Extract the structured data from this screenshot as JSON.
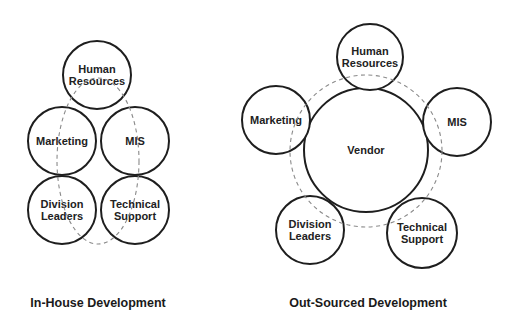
{
  "diagrams": [
    {
      "id": "in-house",
      "caption": "In-House Development",
      "caption_pos": {
        "x": 98,
        "y": 307
      },
      "boundary": {
        "shape": "ellipse",
        "cx": 98,
        "cy": 161,
        "rx": 41,
        "ry": 83
      },
      "nodes": [
        {
          "name": "human-resources",
          "lines": [
            "Human",
            "Resources"
          ],
          "cx": 97,
          "cy": 75,
          "r": 34
        },
        {
          "name": "marketing",
          "lines": [
            "Marketing"
          ],
          "cx": 62,
          "cy": 141,
          "r": 34
        },
        {
          "name": "mis",
          "lines": [
            "MIS"
          ],
          "cx": 135,
          "cy": 141,
          "r": 34
        },
        {
          "name": "division-leaders",
          "lines": [
            "Division",
            "Leaders"
          ],
          "cx": 62,
          "cy": 210,
          "r": 34
        },
        {
          "name": "technical-support",
          "lines": [
            "Technical",
            "Support"
          ],
          "cx": 135,
          "cy": 210,
          "r": 34
        }
      ]
    },
    {
      "id": "out-sourced",
      "caption": "Out-Sourced Development",
      "caption_pos": {
        "x": 368,
        "y": 307
      },
      "boundary": {
        "shape": "circle",
        "cx": 366,
        "cy": 151,
        "r": 76
      },
      "center_node": {
        "name": "vendor",
        "lines": [
          "Vendor"
        ],
        "cx": 366,
        "cy": 150,
        "r": 62
      },
      "nodes": [
        {
          "name": "human-resources",
          "lines": [
            "Human",
            "Resources"
          ],
          "cx": 370,
          "cy": 57,
          "r": 33
        },
        {
          "name": "marketing",
          "lines": [
            "Marketing"
          ],
          "cx": 276,
          "cy": 120,
          "r": 34
        },
        {
          "name": "mis",
          "lines": [
            "MIS"
          ],
          "cx": 457,
          "cy": 122,
          "r": 34
        },
        {
          "name": "division-leaders",
          "lines": [
            "Division",
            "Leaders"
          ],
          "cx": 310,
          "cy": 230,
          "r": 34
        },
        {
          "name": "technical-support",
          "lines": [
            "Technical",
            "Support"
          ],
          "cx": 422,
          "cy": 233,
          "r": 35
        }
      ]
    }
  ],
  "colors": {
    "stroke": "#1e1e1e",
    "dashed": "#8a8a8a",
    "text": "#222222",
    "background": "#ffffff"
  }
}
